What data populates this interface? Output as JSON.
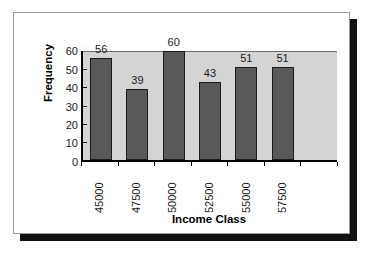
{
  "chart_data": {
    "type": "bar",
    "title": "",
    "subtitle": "",
    "xlabel": "Income Class",
    "ylabel": "Frequency",
    "categories": [
      "45000",
      "47500",
      "50000",
      "52500",
      "55000",
      "57500"
    ],
    "values": [
      56,
      39,
      60,
      43,
      51,
      51
    ],
    "data_labels": [
      "56",
      "39",
      "60",
      "43",
      "51",
      "51"
    ],
    "ylim": [
      0,
      60
    ],
    "ytick_labels": [
      "0",
      "10",
      "20",
      "30",
      "40",
      "50",
      "60"
    ],
    "ytick_values": [
      0,
      10,
      20,
      30,
      40,
      50,
      60
    ],
    "grid": false,
    "legend": false,
    "legend_position": "none",
    "empty_trailing_category_slots": 1,
    "colors": {
      "bar_fill": "#595959",
      "bar_outline": "#1a1a1a",
      "plot_background": "#d4d4d4",
      "axis": "#000000",
      "text": "#1a1a1a",
      "card_background": "#ffffff",
      "card_border": "#9a9a9a",
      "card_shadow": "#111111"
    }
  }
}
